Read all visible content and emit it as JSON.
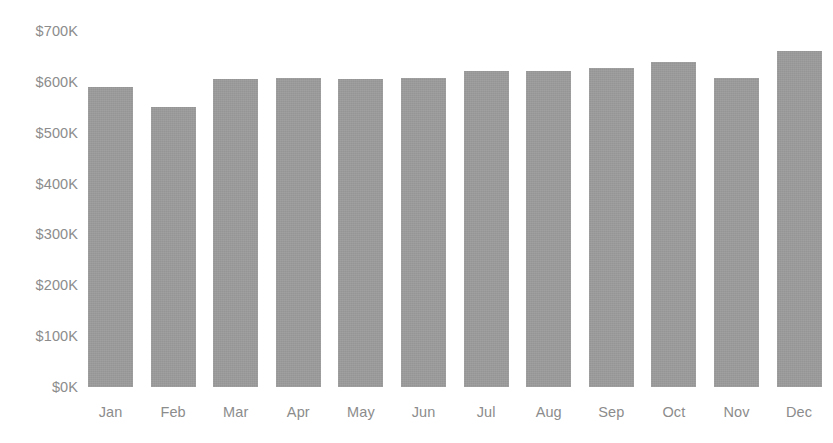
{
  "chart_data": {
    "type": "bar",
    "title": "",
    "subtitle": "",
    "xlabel": "",
    "ylabel": "",
    "categories": [
      "Jan",
      "Feb",
      "Mar",
      "Apr",
      "May",
      "Jun",
      "Jul",
      "Aug",
      "Sep",
      "Oct",
      "Nov",
      "Dec"
    ],
    "values": [
      590000,
      550000,
      605000,
      608000,
      605000,
      608000,
      622000,
      622000,
      628000,
      640000,
      608000,
      660000
    ],
    "value_labels": [
      "$590K",
      "$550K",
      "$605K",
      "$608K",
      "$605K",
      "$608K",
      "$622K",
      "$622K",
      "$628K",
      "$640K",
      "$608K",
      "$660K"
    ],
    "ylim": [
      0,
      700000
    ],
    "ytick_values": [
      0,
      100000,
      200000,
      300000,
      400000,
      500000,
      600000,
      700000
    ],
    "ytick_labels": [
      "$0K",
      "$100K",
      "$200K",
      "$300K",
      "$400K",
      "$500K",
      "$600K",
      "$700K"
    ],
    "xtick_labels": [
      "Jan",
      "Feb",
      "Mar",
      "Apr",
      "May",
      "Jun",
      "Jul",
      "Aug",
      "Sep",
      "Oct",
      "Nov",
      "Dec"
    ],
    "grid": false,
    "legend": false,
    "legend_position": "none",
    "series": [
      {
        "name": "",
        "color": "#9a9a9a",
        "values": [
          590000,
          550000,
          605000,
          608000,
          605000,
          608000,
          622000,
          622000,
          628000,
          640000,
          608000,
          660000
        ]
      }
    ]
  },
  "colors": {
    "bar": "#9a9a9a",
    "text": "#8c8c8c",
    "background": "#ffffff"
  }
}
